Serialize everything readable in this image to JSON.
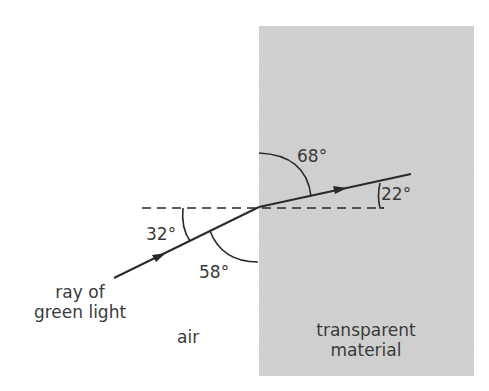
{
  "diagram": {
    "regions": {
      "left_medium": "air",
      "right_medium_line1": "transparent",
      "right_medium_line2": "material"
    },
    "ray_label_line1": "ray of",
    "ray_label_line2": "green light",
    "angles": {
      "incident_to_normal": "32°",
      "incident_to_surface": "58°",
      "refracted_to_surface": "68°",
      "refracted_to_normal": "22°"
    },
    "colors": {
      "material_fill": "#c9c9c9",
      "line": "#2a2a2a",
      "text": "#3a3a3a",
      "background": "#ffffff"
    }
  }
}
